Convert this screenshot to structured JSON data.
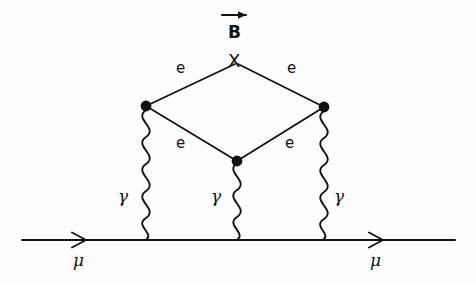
{
  "figure": {
    "type": "feynman-diagram",
    "title": "",
    "background_color": "#fdfdfd",
    "ink_color": "#121212",
    "external_fermion_line": {
      "particle_label_left": "μ",
      "particle_label_right": "μ",
      "direction": "left-to-right"
    },
    "external_field": {
      "label": "B",
      "vector_arrow": true,
      "arrow_direction": "right"
    },
    "vertex_labels": {
      "external_field_vertex": "X"
    },
    "internal_fermion_labels": {
      "upper_left": "e",
      "upper_right": "e",
      "lower_left": "e",
      "lower_right": "e"
    },
    "photon_labels": {
      "left": "γ",
      "center": "γ",
      "right": "γ"
    }
  },
  "nodes": {
    "x_vertex": {
      "name": "X",
      "x": 235,
      "y": 72,
      "dot": false
    },
    "left_vertex": {
      "name": "left-loop-vertex",
      "x": 146,
      "y": 106,
      "dot": true
    },
    "right_vertex": {
      "name": "right-loop-vertex",
      "x": 324,
      "y": 107,
      "dot": true
    },
    "bottom_vertex": {
      "name": "bottom-loop-vertex",
      "x": 237,
      "y": 161,
      "dot": true
    },
    "left_photon_base": {
      "name": "left-photon-base",
      "x": 146,
      "y": 240
    },
    "center_photon_base": {
      "name": "center-photon-base",
      "x": 237,
      "y": 240
    },
    "right_photon_base": {
      "name": "right-photon-base",
      "x": 323,
      "y": 240
    }
  },
  "label_positions": {
    "b_field": {
      "x": 228,
      "y": 24
    },
    "b_arrow": {
      "x": 222,
      "y": 14,
      "width": 24
    },
    "x_vertex": {
      "x": 228,
      "y": 52
    },
    "e_upper_left": {
      "x": 176,
      "y": 61
    },
    "e_upper_right": {
      "x": 287,
      "y": 61
    },
    "e_lower_left": {
      "x": 176,
      "y": 136
    },
    "e_lower_right": {
      "x": 285,
      "y": 136
    },
    "gamma_left": {
      "x": 118,
      "y": 188
    },
    "gamma_center": {
      "x": 211,
      "y": 188
    },
    "gamma_right": {
      "x": 334,
      "y": 188
    },
    "mu_left": {
      "x": 73,
      "y": 252
    },
    "mu_right": {
      "x": 370,
      "y": 252
    }
  }
}
